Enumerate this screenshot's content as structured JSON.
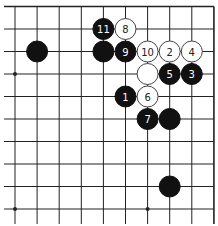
{
  "diagram": {
    "type": "go-board-fragment",
    "columns": 10,
    "rows": 10,
    "edges": {
      "top": true,
      "right": true,
      "left": false,
      "bottom": false
    },
    "colors": {
      "black": "#111111",
      "white": "#ffffff",
      "line": "#222222",
      "black_label": "#ffffff",
      "white_label": "#222222"
    },
    "star_points": [
      {
        "col": 0,
        "row": 3
      },
      {
        "col": 0,
        "row": 9
      },
      {
        "col": 6,
        "row": 9
      }
    ],
    "stones": [
      {
        "color": "black",
        "col": 1,
        "row": 2,
        "label": ""
      },
      {
        "color": "black",
        "col": 4,
        "row": 1,
        "label": "11"
      },
      {
        "color": "white",
        "col": 5,
        "row": 1,
        "label": "8"
      },
      {
        "color": "black",
        "col": 4,
        "row": 2,
        "label": ""
      },
      {
        "color": "black",
        "col": 5,
        "row": 2,
        "label": "9"
      },
      {
        "color": "white",
        "col": 6,
        "row": 2,
        "label": "10"
      },
      {
        "color": "white",
        "col": 7,
        "row": 2,
        "label": "2"
      },
      {
        "color": "white",
        "col": 8,
        "row": 2,
        "label": "4"
      },
      {
        "color": "white",
        "col": 6,
        "row": 3,
        "label": ""
      },
      {
        "color": "black",
        "col": 7,
        "row": 3,
        "label": "5"
      },
      {
        "color": "black",
        "col": 8,
        "row": 3,
        "label": "3"
      },
      {
        "color": "black",
        "col": 5,
        "row": 4,
        "label": "1"
      },
      {
        "color": "white",
        "col": 6,
        "row": 4,
        "label": "6"
      },
      {
        "color": "black",
        "col": 6,
        "row": 5,
        "label": "7"
      },
      {
        "color": "black",
        "col": 7,
        "row": 5,
        "label": ""
      },
      {
        "color": "black",
        "col": 7,
        "row": 8,
        "label": ""
      }
    ]
  }
}
